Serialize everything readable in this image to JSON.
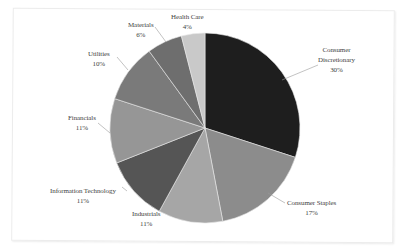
{
  "chart_data": {
    "type": "pie",
    "title": "",
    "categories": [
      "Consumer Discretionary",
      "Consumer Staples",
      "Industrials",
      "Information Technology",
      "Financials",
      "Utilities",
      "Materials",
      "Health Care"
    ],
    "values": [
      30,
      17,
      11,
      11,
      11,
      10,
      6,
      4
    ],
    "value_labels": [
      "30%",
      "17%",
      "11%",
      "11%",
      "11%",
      "10%",
      "6%",
      "4%"
    ],
    "colors": [
      "#1e1e1e",
      "#8c8c8c",
      "#a6a6a6",
      "#555555",
      "#969696",
      "#7a7a7a",
      "#6e6e6e",
      "#c9c9c9"
    ],
    "start_angle_deg": 0,
    "direction": "clockwise",
    "legend": "none (data labels with leader lines)"
  },
  "labels": [
    {
      "name": "Consumer",
      "name2": "Discretionary",
      "pct": "30%"
    },
    {
      "name": "Consumer Staples",
      "pct": "17%"
    },
    {
      "name": "Industrials",
      "pct": "11%"
    },
    {
      "name": "Information Technology",
      "pct": "11%"
    },
    {
      "name": "Financials",
      "pct": "11%"
    },
    {
      "name": "Utilities",
      "pct": "10%"
    },
    {
      "name": "Materials",
      "pct": "6%"
    },
    {
      "name": "Health Care",
      "pct": "4%"
    }
  ]
}
